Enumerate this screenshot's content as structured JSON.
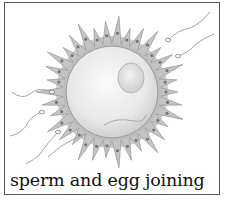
{
  "figure": {
    "caption": "sperm and egg joining",
    "colors": {
      "border": "#555555",
      "corona": "#b8b8b8",
      "egg": "#ececec",
      "nucleus": "#e2e2e2",
      "caption_text": "#111111"
    }
  }
}
